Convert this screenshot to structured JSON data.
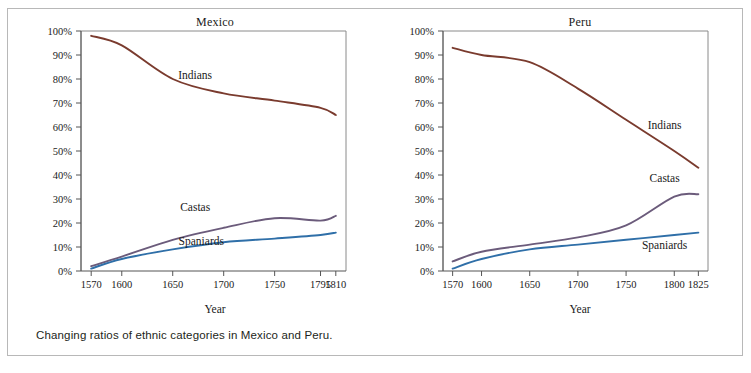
{
  "figure": {
    "caption": "Changing ratios of ethnic categories in Mexico and Peru.",
    "top_remnant": "",
    "frame_color": "#b8b8b8"
  },
  "colors": {
    "indians": "#7a3b2e",
    "castas": "#6b5b7b",
    "spaniards": "#2f6fa8",
    "axis": "#555555",
    "plot_border": "#8a8a8a",
    "text": "#1a1a1a"
  },
  "chart_data": [
    {
      "type": "line",
      "title": "Mexico",
      "xlabel": "Year",
      "ylabel": "",
      "xlim": [
        1560,
        1820
      ],
      "ylim": [
        0,
        100
      ],
      "grid": false,
      "legend": "inline-labels",
      "xticks": [
        "1570",
        "1600",
        "1650",
        "1700",
        "1750",
        "1795",
        "1810"
      ],
      "xtick_values": [
        1570,
        1600,
        1650,
        1700,
        1750,
        1795,
        1810
      ],
      "yticks": [
        "0%",
        "10%",
        "20%",
        "30%",
        "40%",
        "50%",
        "60%",
        "70%",
        "80%",
        "90%",
        "100%"
      ],
      "ytick_values": [
        0,
        10,
        20,
        30,
        40,
        50,
        60,
        70,
        80,
        90,
        100
      ],
      "x": [
        1570,
        1600,
        1650,
        1700,
        1750,
        1795,
        1810
      ],
      "series": [
        {
          "name": "Indians",
          "color": "#7a3b2e",
          "values": [
            98,
            94,
            80,
            74,
            71,
            68,
            65
          ],
          "label_x": 1672,
          "label_y": 80
        },
        {
          "name": "Castas",
          "color": "#6b5b7b",
          "values": [
            2,
            6,
            13,
            18,
            22,
            21,
            23
          ],
          "label_x": 1672,
          "label_y": 25
        },
        {
          "name": "Spaniards",
          "color": "#2f6fa8",
          "values": [
            1,
            5,
            9,
            12,
            13.5,
            15,
            16
          ],
          "label_x": 1678,
          "label_y": 11
        }
      ]
    },
    {
      "type": "line",
      "title": "Peru",
      "xlabel": "Year",
      "ylabel": "",
      "xlim": [
        1560,
        1835
      ],
      "ylim": [
        0,
        100
      ],
      "grid": false,
      "legend": "inline-labels",
      "xticks": [
        "1570",
        "1600",
        "1650",
        "1700",
        "1750",
        "1800",
        "1825"
      ],
      "xtick_values": [
        1570,
        1600,
        1650,
        1700,
        1750,
        1800,
        1825
      ],
      "yticks": [
        "0%",
        "10%",
        "20%",
        "30%",
        "40%",
        "50%",
        "60%",
        "70%",
        "80%",
        "90%",
        "100%"
      ],
      "ytick_values": [
        0,
        10,
        20,
        30,
        40,
        50,
        60,
        70,
        80,
        90,
        100
      ],
      "x": [
        1570,
        1600,
        1650,
        1700,
        1750,
        1800,
        1825
      ],
      "series": [
        {
          "name": "Indians",
          "color": "#7a3b2e",
          "values": [
            93,
            90,
            87,
            76,
            63,
            50,
            43
          ],
          "label_x": 1790,
          "label_y": 59
        },
        {
          "name": "Castas",
          "color": "#6b5b7b",
          "values": [
            4,
            8,
            11,
            14,
            19,
            31,
            32
          ],
          "label_x": 1790,
          "label_y": 37
        },
        {
          "name": "Spaniards",
          "color": "#2f6fa8",
          "values": [
            1,
            5,
            9,
            11,
            13,
            15,
            16
          ],
          "label_x": 1790,
          "label_y": 9
        }
      ]
    }
  ]
}
